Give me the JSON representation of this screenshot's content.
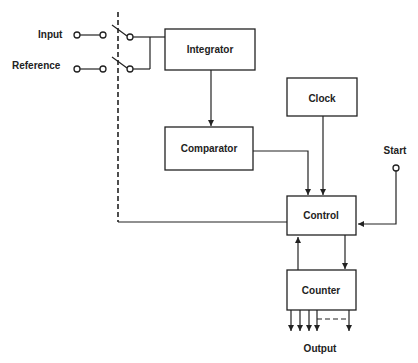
{
  "diagram": {
    "type": "block-diagram",
    "blocks": {
      "integrator": "Integrator",
      "comparator": "Comparator",
      "clock": "Clock",
      "control": "Control",
      "counter": "Counter"
    },
    "inputs": {
      "input": "Input",
      "reference": "Reference",
      "start": "Start"
    },
    "outputs": {
      "output": "Output"
    },
    "connections": [
      {
        "from": "Input",
        "to": "Integrator",
        "via": "switch"
      },
      {
        "from": "Reference",
        "to": "Integrator",
        "via": "switch"
      },
      {
        "from": "Integrator",
        "to": "Comparator"
      },
      {
        "from": "Comparator",
        "to": "Control"
      },
      {
        "from": "Clock",
        "to": "Control"
      },
      {
        "from": "Start",
        "to": "Control"
      },
      {
        "from": "Control",
        "to": "Counter"
      },
      {
        "from": "Counter",
        "to": "Control"
      },
      {
        "from": "Control",
        "to": "switches",
        "style": "dashed mechanical link"
      },
      {
        "from": "Counter",
        "to": "Output",
        "style": "parallel bus"
      }
    ]
  }
}
